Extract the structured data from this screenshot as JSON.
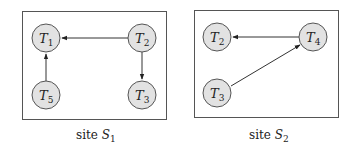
{
  "panels": [
    {
      "caption_prefix": "site",
      "caption_site": "S",
      "caption_sub": "1",
      "nodes": [
        {
          "id": "T1",
          "letter": "T",
          "sub": "1"
        },
        {
          "id": "T2",
          "letter": "T",
          "sub": "2"
        },
        {
          "id": "T3",
          "letter": "T",
          "sub": "3"
        },
        {
          "id": "T5",
          "letter": "T",
          "sub": "5"
        }
      ],
      "edges": [
        {
          "from": "T2",
          "to": "T1"
        },
        {
          "from": "T2",
          "to": "T3"
        },
        {
          "from": "T5",
          "to": "T1"
        }
      ]
    },
    {
      "caption_prefix": "site",
      "caption_site": "S",
      "caption_sub": "2",
      "nodes": [
        {
          "id": "T2",
          "letter": "T",
          "sub": "2"
        },
        {
          "id": "T4",
          "letter": "T",
          "sub": "4"
        },
        {
          "id": "T3",
          "letter": "T",
          "sub": "3"
        }
      ],
      "edges": [
        {
          "from": "T4",
          "to": "T2"
        },
        {
          "from": "T3",
          "to": "T4"
        }
      ]
    }
  ]
}
